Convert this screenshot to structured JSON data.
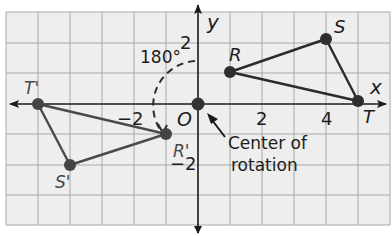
{
  "figure": {
    "colors": {
      "background": "#eeeeee",
      "grid": "#a8a8a8",
      "axis": "#1a1a1a",
      "segment": "#2b2b2b",
      "point": "#333333",
      "text": "#1c1c1c"
    }
  },
  "axes": {
    "x_label": "x",
    "y_label": "y",
    "origin_label": "O",
    "ticks": {
      "x_neg2": "−2",
      "x_2": "2",
      "x_4": "4",
      "y_2": "2",
      "y_neg2": "−2"
    },
    "x_range": [
      -6,
      6
    ],
    "y_range": [
      -4,
      3
    ]
  },
  "triangle_original": {
    "points": [
      {
        "label": "R",
        "x": 1,
        "y": 1
      },
      {
        "label": "S",
        "x": 4,
        "y": 2
      },
      {
        "label": "T",
        "x": 5,
        "y": 0
      }
    ]
  },
  "triangle_image": {
    "points": [
      {
        "label": "R'",
        "x": -1,
        "y": -1
      },
      {
        "label": "S'",
        "x": -4,
        "y": -2
      },
      {
        "label": "T'",
        "x": -5,
        "y": 0
      }
    ]
  },
  "annotations": {
    "angle": "180°",
    "center_line1": "Center of",
    "center_line2": "rotation"
  }
}
